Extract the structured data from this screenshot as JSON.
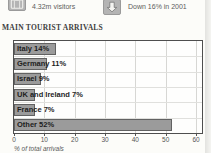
{
  "header": {
    "visitors": {
      "icon": "suitcase-icon",
      "label": "4.32m visitors"
    },
    "trend": {
      "icon": "down-arrow-icon",
      "label": "Down 16% in 2001"
    }
  },
  "title": "MAIN TOURIST ARRIVALS",
  "chart_data": {
    "type": "bar",
    "orientation": "horizontal",
    "title": "MAIN TOURIST ARRIVALS",
    "categories": [
      "Italy",
      "Germany",
      "Israel",
      "UK and Ireland",
      "France",
      "Other"
    ],
    "values": [
      14,
      11,
      9,
      7,
      7,
      52
    ],
    "bar_labels": [
      "Italy 14%",
      "Germany 11%",
      "Israel 9%",
      "UK and Ireland 7%",
      "France 7%",
      "Other 52%"
    ],
    "xlabel": "% of total arrivals",
    "xlim": [
      0,
      60
    ],
    "xticks": [
      0,
      10,
      20,
      30,
      40,
      50,
      60
    ],
    "grid": true,
    "legend": "none",
    "bar_color": "#9b9b9b",
    "bar_border_color": "#626262",
    "grid_color": "#d7d7d4",
    "row_separator_color": "#e0e0dd"
  },
  "colors": {
    "icon_background": "#b4b4b4",
    "chart_border": "#4e4e4e",
    "label_text": "#1d1d1d",
    "axis_text": "#555555"
  }
}
